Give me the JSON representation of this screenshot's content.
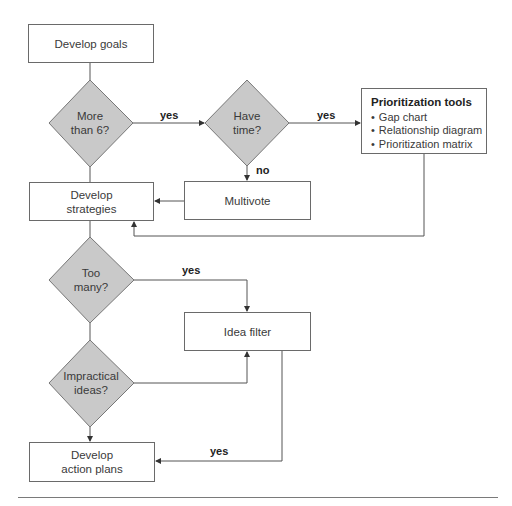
{
  "colors": {
    "decision_fill": "#c9c9c9",
    "line": "#555555",
    "box_border": "#6a6a6a"
  },
  "nodes": {
    "develop_goals": "Develop goals",
    "more_than_6": [
      "More",
      "than 6?"
    ],
    "have_time": [
      "Have",
      "time?"
    ],
    "prioritization_tools": {
      "title": "Prioritization tools",
      "items": [
        "Gap chart",
        "Relationship diagram",
        "Prioritization matrix"
      ]
    },
    "develop_strategies": [
      "Develop",
      "strategies"
    ],
    "multivote": "Multivote",
    "too_many": [
      "Too",
      "many?"
    ],
    "idea_filter": "Idea filter",
    "impractical_ideas": [
      "Impractical",
      "ideas?"
    ],
    "develop_action_plans": [
      "Develop",
      "action plans"
    ]
  },
  "edge_labels": {
    "more_to_have_time": "yes",
    "have_time_to_tools": "yes",
    "have_time_to_multivote": "no",
    "too_many_to_filter": "yes",
    "filter_to_action_plans": "yes"
  }
}
